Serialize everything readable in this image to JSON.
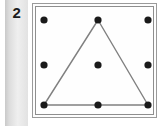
{
  "panel": {
    "item_number": "2",
    "background_color": "#fefefe",
    "border_color": "#8e8e8e",
    "strip_color": "#dcdcdc"
  },
  "figure": {
    "title": "",
    "dot_color": "#1a1a1a",
    "line_color": "#808080",
    "dot_radius": 3.6,
    "line_width": 1.4,
    "grid": {
      "rows": 3,
      "cols": 3,
      "points": [
        {
          "name": "top-left",
          "x": 44,
          "y": 20
        },
        {
          "name": "top-center",
          "x": 98,
          "y": 20
        },
        {
          "name": "top-right",
          "x": 148,
          "y": 20
        },
        {
          "name": "middle-left",
          "x": 44,
          "y": 65
        },
        {
          "name": "middle-center",
          "x": 98,
          "y": 65
        },
        {
          "name": "middle-right",
          "x": 148,
          "y": 65
        },
        {
          "name": "bottom-left",
          "x": 44,
          "y": 105
        },
        {
          "name": "bottom-center",
          "x": 98,
          "y": 105
        },
        {
          "name": "bottom-right",
          "x": 148,
          "y": 105
        }
      ]
    },
    "shape": {
      "type": "triangle",
      "vertices": [
        "top-center",
        "bottom-left",
        "bottom-right"
      ],
      "path": "98,20 44,105 148,105"
    }
  }
}
